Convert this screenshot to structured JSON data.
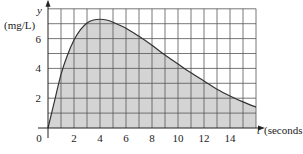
{
  "chart_data": {
    "type": "area",
    "title": "",
    "xlabel": "t (seconds)",
    "ylabel": "y (mg/L)",
    "x_axis_name": "t",
    "x_axis_unit": "(seconds)",
    "y_axis_name": "y",
    "y_axis_unit": "(mg/L)",
    "xlim": [
      0,
      16
    ],
    "ylim": [
      0,
      8
    ],
    "x_ticks": [
      "0",
      "2",
      "4",
      "6",
      "8",
      "10",
      "12",
      "14"
    ],
    "y_ticks": [
      "2",
      "4",
      "6"
    ],
    "grid": true,
    "grid_step": 1,
    "x": [
      0,
      0.5,
      1,
      1.5,
      2,
      2.5,
      3,
      3.5,
      4,
      4.5,
      5,
      6,
      7,
      8,
      9,
      10,
      11,
      12,
      13,
      14,
      15,
      16
    ],
    "values": [
      0,
      1.8,
      3.6,
      4.9,
      5.9,
      6.6,
      7.05,
      7.25,
      7.3,
      7.25,
      7.1,
      6.7,
      6.15,
      5.55,
      4.9,
      4.3,
      3.7,
      3.15,
      2.6,
      2.15,
      1.75,
      1.4
    ],
    "fill_color": "#d4d4d4",
    "line_color": "#333333",
    "grid_color": "#555555"
  }
}
